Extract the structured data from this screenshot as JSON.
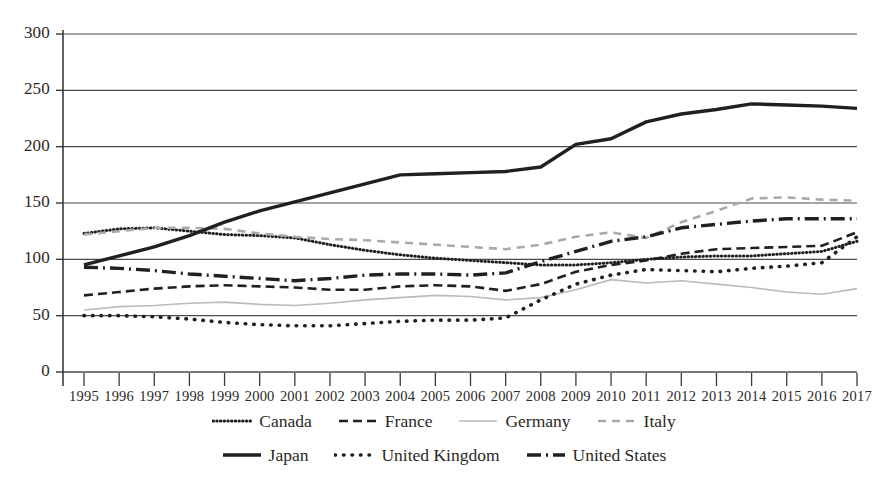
{
  "chart_data": {
    "type": "line",
    "title": "",
    "subtitle": "",
    "xlabel": "",
    "ylabel": "",
    "xlim": [
      1995,
      2017
    ],
    "ylim": [
      0,
      300
    ],
    "ytick_step": 50,
    "grid": true,
    "grid_axis": "y",
    "legend_position": "bottom",
    "x": [
      1995,
      1996,
      1997,
      1998,
      1999,
      2000,
      2001,
      2002,
      2003,
      2004,
      2005,
      2006,
      2007,
      2008,
      2009,
      2010,
      2011,
      2012,
      2013,
      2014,
      2015,
      2016,
      2017
    ],
    "categories": [
      "1995",
      "1996",
      "1997",
      "1998",
      "1999",
      "2000",
      "2001",
      "2002",
      "2003",
      "2004",
      "2005",
      "2006",
      "2007",
      "2008",
      "2009",
      "2010",
      "2011",
      "2012",
      "2013",
      "2014",
      "2015",
      "2016",
      "2017"
    ],
    "yticks": [
      0,
      50,
      100,
      150,
      200,
      250,
      300
    ],
    "ytick_labels": [
      "0",
      "50",
      "100",
      "150",
      "200",
      "250",
      "300"
    ],
    "series": [
      {
        "name": "Canada",
        "style": "fine-dotted",
        "color": "#231f20",
        "width": 3,
        "dash": "0.5,3.2",
        "values": [
          123,
          127,
          128,
          125,
          122,
          121,
          119,
          113,
          108,
          104,
          101,
          99,
          97,
          95,
          95,
          97,
          100,
          102,
          103,
          103,
          105,
          107,
          116
        ]
      },
      {
        "name": "France",
        "style": "dashed-bold",
        "color": "#231f20",
        "width": 2.6,
        "dash": "9,5",
        "values": [
          68,
          71,
          74,
          76,
          77,
          76,
          75,
          73,
          73,
          76,
          77,
          76,
          72,
          78,
          89,
          95,
          99,
          105,
          109,
          110,
          111,
          112,
          124
        ]
      },
      {
        "name": "Germany",
        "style": "thin-solid-light",
        "color": "#b9bbbd",
        "width": 1.6,
        "dash": "none",
        "values": [
          55,
          58,
          59,
          61,
          62,
          60,
          59,
          61,
          64,
          66,
          68,
          67,
          64,
          66,
          73,
          82,
          79,
          81,
          78,
          75,
          71,
          69,
          74
        ]
      },
      {
        "name": "Italy",
        "style": "dashed-light",
        "color": "#a7a9ac",
        "width": 2.6,
        "dash": "8,6",
        "values": [
          122,
          125,
          128,
          128,
          127,
          123,
          120,
          118,
          117,
          115,
          113,
          111,
          109,
          113,
          120,
          124,
          119,
          133,
          143,
          154,
          155,
          153,
          152
        ]
      },
      {
        "name": "Japan",
        "style": "thick-solid",
        "color": "#231f20",
        "width": 3.4,
        "dash": "none",
        "values": [
          95,
          103,
          111,
          121,
          133,
          143,
          151,
          159,
          167,
          175,
          176,
          177,
          178,
          182,
          202,
          207,
          222,
          229,
          233,
          238,
          237,
          236,
          234
        ]
      },
      {
        "name": "United Kingdom",
        "style": "round-dotted",
        "color": "#231f20",
        "width": 3.6,
        "dash": "0.5,8",
        "values": [
          50,
          50,
          49,
          47,
          44,
          42,
          41,
          41,
          43,
          45,
          46,
          46,
          48,
          64,
          78,
          86,
          91,
          90,
          89,
          92,
          94,
          97,
          120
        ]
      },
      {
        "name": "United States",
        "style": "dash-dot-bold",
        "color": "#231f20",
        "width": 3.4,
        "dash": "14,5,2,5",
        "values": [
          93,
          92,
          90,
          87,
          85,
          83,
          81,
          83,
          86,
          87,
          87,
          86,
          88,
          98,
          107,
          116,
          120,
          128,
          131,
          134,
          136,
          136,
          136
        ]
      }
    ]
  },
  "legend": {
    "rows": [
      [
        {
          "label": "Canada",
          "swatch": "fine-dotted"
        },
        {
          "label": "France",
          "swatch": "dashed-bold"
        },
        {
          "label": "Germany",
          "swatch": "thin-solid-light"
        },
        {
          "label": "Italy",
          "swatch": "dashed-light"
        }
      ],
      [
        {
          "label": "Japan",
          "swatch": "thick-solid"
        },
        {
          "label": "United Kingdom",
          "swatch": "round-dotted"
        },
        {
          "label": "United States",
          "swatch": "dash-dot-bold"
        }
      ]
    ]
  },
  "colors": {
    "axis": "#3a3a3a",
    "grid": "#4a4a4a",
    "text": "#2b2724",
    "series_dark": "#231f20",
    "series_light": "#a7a9ac",
    "series_lighter": "#b9bbbd",
    "background": "#ffffff"
  }
}
